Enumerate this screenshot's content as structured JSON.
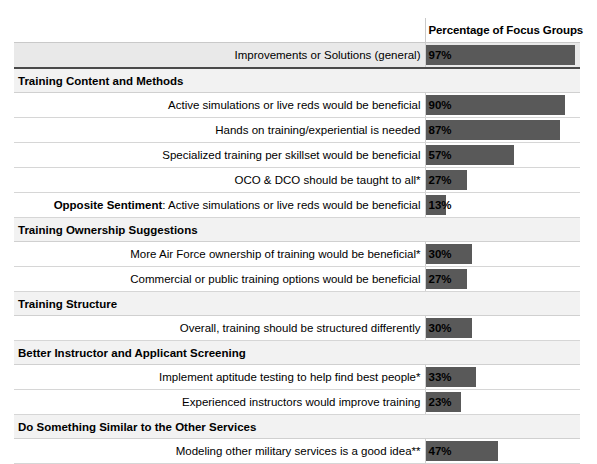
{
  "table": {
    "header": {
      "label_column": "",
      "value_column": "Percentage of Focus Groups"
    },
    "bar_color": "#595959",
    "section_bg": "#f2f2f2",
    "highlight_row_bg": "#e9e9e9",
    "scale_max": 100,
    "rows": [
      {
        "kind": "data",
        "label": "Improvements or Solutions (general)",
        "bold_lead": "",
        "value_text": "97%",
        "value": 97,
        "shaded": true,
        "thick_under": true
      },
      {
        "kind": "section",
        "label": "Training Content and Methods"
      },
      {
        "kind": "data",
        "label": "Active simulations or live reds would be beneficial",
        "bold_lead": "",
        "value_text": "90%",
        "value": 90,
        "shaded": false,
        "thick_under": false
      },
      {
        "kind": "data",
        "label": "Hands on training/experiential is needed",
        "bold_lead": "",
        "value_text": "87%",
        "value": 87,
        "shaded": false,
        "thick_under": false
      },
      {
        "kind": "data",
        "label": "Specialized training per skillset would be beneficial",
        "bold_lead": "",
        "value_text": "57%",
        "value": 57,
        "shaded": false,
        "thick_under": false
      },
      {
        "kind": "data",
        "label": "OCO & DCO should be taught to all*",
        "bold_lead": "",
        "value_text": "27%",
        "value": 27,
        "shaded": false,
        "thick_under": false
      },
      {
        "kind": "data",
        "label": ": Active simulations or live reds would be beneficial",
        "bold_lead": "Opposite Sentiment",
        "value_text": "13%",
        "value": 13,
        "shaded": false,
        "thick_under": false
      },
      {
        "kind": "section",
        "label": "Training Ownership Suggestions"
      },
      {
        "kind": "data",
        "label": "More Air Force ownership of training would be beneficial*",
        "bold_lead": "",
        "value_text": "30%",
        "value": 30,
        "shaded": false,
        "thick_under": false
      },
      {
        "kind": "data",
        "label": "Commercial or public training options would be beneficial",
        "bold_lead": "",
        "value_text": "27%",
        "value": 27,
        "shaded": false,
        "thick_under": false
      },
      {
        "kind": "section",
        "label": "Training Structure"
      },
      {
        "kind": "data",
        "label": "Overall, training should be structured differently",
        "bold_lead": "",
        "value_text": "30%",
        "value": 30,
        "shaded": false,
        "thick_under": false
      },
      {
        "kind": "section",
        "label": "Better Instructor and Applicant Screening"
      },
      {
        "kind": "data",
        "label": "Implement aptitude testing to help find best people*",
        "bold_lead": "",
        "value_text": "33%",
        "value": 33,
        "shaded": false,
        "thick_under": false
      },
      {
        "kind": "data",
        "label": "Experienced instructors would improve training",
        "bold_lead": "",
        "value_text": "23%",
        "value": 23,
        "shaded": false,
        "thick_under": false
      },
      {
        "kind": "section",
        "label": "Do Something Similar to the Other Services"
      },
      {
        "kind": "data",
        "label": "Modeling other military services is a good idea**",
        "bold_lead": "",
        "value_text": "47%",
        "value": 47,
        "shaded": false,
        "thick_under": false
      }
    ]
  },
  "chart_data": {
    "type": "bar",
    "title": "Percentage of Focus Groups",
    "xlabel": "Percentage of Focus Groups",
    "ylabel": "",
    "xlim": [
      0,
      100
    ],
    "grid": false,
    "legend": null,
    "orientation": "horizontal",
    "categories": [
      "Improvements or Solutions (general)",
      "Active simulations or live reds would be beneficial",
      "Hands on training/experiential is needed",
      "Specialized training per skillset would be beneficial",
      "OCO & DCO should be taught to all*",
      "Opposite Sentiment: Active simulations or live reds would be beneficial",
      "More Air Force ownership of training would be beneficial*",
      "Commercial or public training options would be beneficial",
      "Overall, training should be structured differently",
      "Implement aptitude testing to help find best people*",
      "Experienced instructors would improve training",
      "Modeling other military services is a good idea**"
    ],
    "values": [
      97,
      90,
      87,
      57,
      27,
      13,
      30,
      27,
      30,
      33,
      23,
      47
    ],
    "groups": [
      {
        "name": "(ungrouped)",
        "categories": [
          "Improvements or Solutions (general)"
        ]
      },
      {
        "name": "Training Content and Methods",
        "categories": [
          "Active simulations or live reds would be beneficial",
          "Hands on training/experiential is needed",
          "Specialized training per skillset would be beneficial",
          "OCO & DCO should be taught to all*",
          "Opposite Sentiment: Active simulations or live reds would be beneficial"
        ]
      },
      {
        "name": "Training Ownership Suggestions",
        "categories": [
          "More Air Force ownership of training would be beneficial*",
          "Commercial or public training options would be beneficial"
        ]
      },
      {
        "name": "Training Structure",
        "categories": [
          "Overall, training should be structured differently"
        ]
      },
      {
        "name": "Better Instructor and Applicant Screening",
        "categories": [
          "Implement aptitude testing to help find best people*",
          "Experienced instructors would improve training"
        ]
      },
      {
        "name": "Do Something Similar to the Other Services",
        "categories": [
          "Modeling other military services is a good idea**"
        ]
      }
    ]
  }
}
